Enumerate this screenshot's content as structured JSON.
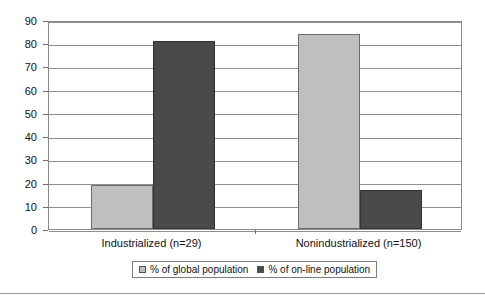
{
  "chart_data": {
    "type": "bar",
    "title": "",
    "xlabel": "",
    "ylabel": "",
    "categories": [
      "Industrialized (n=29)",
      "Nonindustrialized (n=150)"
    ],
    "series": [
      {
        "name": "% of global population",
        "values": [
          19,
          84
        ],
        "color": "#bfbfbf"
      },
      {
        "name": "% of on-line population",
        "values": [
          81,
          17
        ],
        "color": "#4a4a4a"
      }
    ],
    "ylim": [
      0,
      90
    ],
    "ytick_step": 10,
    "yticks": [
      "0",
      "10",
      "20",
      "30",
      "40",
      "50",
      "60",
      "70",
      "80",
      "90"
    ],
    "grid": true,
    "legend_position": "bottom"
  },
  "legend": {
    "entries": [
      {
        "label": "% of global population",
        "swatch": "legend-swatch-global"
      },
      {
        "label": "% of on-line population",
        "swatch": "legend-swatch-online"
      }
    ]
  }
}
